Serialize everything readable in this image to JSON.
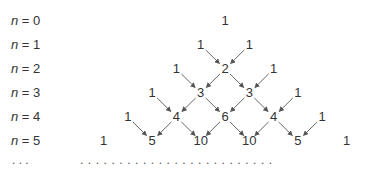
{
  "diagram": {
    "row_labels": [
      {
        "var": "n",
        "eq": " = ",
        "value": "0"
      },
      {
        "var": "n",
        "eq": " = ",
        "value": "1"
      },
      {
        "var": "n",
        "eq": " = ",
        "value": "2"
      },
      {
        "var": "n",
        "eq": " = ",
        "value": "3"
      },
      {
        "var": "n",
        "eq": " = ",
        "value": "4"
      },
      {
        "var": "n",
        "eq": " = ",
        "value": "5"
      }
    ],
    "rows": [
      [
        "1"
      ],
      [
        "1",
        "1"
      ],
      [
        "1",
        "2",
        "1"
      ],
      [
        "1",
        "3",
        "3",
        "1"
      ],
      [
        "1",
        "4",
        "6",
        "4",
        "1"
      ],
      [
        "1",
        "5",
        "10",
        "10",
        "5",
        "1"
      ]
    ],
    "continuation_label": ". . .",
    "continuation_row": ". . . . . . . . . . . . . . . . . . . . . . . . .",
    "colors": {
      "text": "#333333",
      "arrow": "#555555"
    }
  }
}
